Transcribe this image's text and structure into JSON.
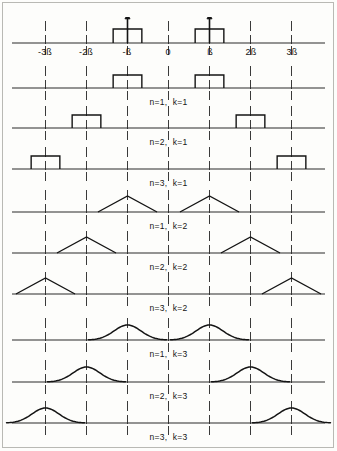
{
  "figure": {
    "title": "",
    "width": 337,
    "height": 451,
    "background": "#fdfdfb",
    "ink_color": "#141414",
    "axis_color": "#2b2b2b",
    "grid_color": "#3a3a3a"
  },
  "axis": {
    "x_start_px": 12,
    "x_end_px": 325,
    "origin_px": 168.5,
    "beta_spacing_px": 41,
    "tick_labels": [
      {
        "text": "-3ß",
        "x_px": 45
      },
      {
        "text": "-2ß",
        "x_px": 86
      },
      {
        "text": "-ß",
        "x_px": 127
      },
      {
        "text": "0",
        "x_px": 168
      },
      {
        "text": "ß",
        "x_px": 210
      },
      {
        "text": "2ß",
        "x_px": 251
      },
      {
        "text": "3ß",
        "x_px": 292
      }
    ],
    "grid_positions_beta": [
      -3,
      -2,
      -1,
      0,
      1,
      2,
      3
    ]
  },
  "panels": [
    {
      "id": "reference",
      "label": "",
      "shape": "rect-impulse",
      "n": 1,
      "k": 1,
      "has_ticklabels": true,
      "has_arrow": true,
      "axis_y_px": 43,
      "pulse_half_width_beta": 0.35,
      "pulse_height_px": 14,
      "arrow_height_px": 30,
      "centers_beta": [
        -1,
        1
      ]
    },
    {
      "id": "n1k1",
      "label": "n=1,  k=1",
      "shape": "rect",
      "n": 1,
      "k": 1,
      "has_ticklabels": false,
      "has_arrow": false,
      "axis_y_px": 88,
      "pulse_half_width_beta": 0.35,
      "pulse_height_px": 13,
      "centers_beta": [
        -1,
        1
      ]
    },
    {
      "id": "n2k1",
      "label": "n=2,  k=1",
      "shape": "rect",
      "n": 2,
      "k": 1,
      "has_ticklabels": false,
      "has_arrow": false,
      "axis_y_px": 128,
      "pulse_half_width_beta": 0.35,
      "pulse_height_px": 13,
      "centers_beta": [
        -2,
        2
      ]
    },
    {
      "id": "n3k1",
      "label": "n=3,  k=1",
      "shape": "rect",
      "n": 3,
      "k": 1,
      "has_ticklabels": false,
      "has_arrow": false,
      "axis_y_px": 169,
      "pulse_half_width_beta": 0.35,
      "pulse_height_px": 13,
      "centers_beta": [
        -3,
        3
      ]
    },
    {
      "id": "n1k2",
      "label": "n=1,  k=2",
      "shape": "triangle",
      "n": 1,
      "k": 2,
      "has_ticklabels": false,
      "has_arrow": false,
      "axis_y_px": 212,
      "pulse_half_width_beta": 0.72,
      "pulse_height_px": 16,
      "centers_beta": [
        -1,
        1
      ]
    },
    {
      "id": "n2k2",
      "label": "n=2,  k=2",
      "shape": "triangle",
      "n": 2,
      "k": 2,
      "has_ticklabels": false,
      "has_arrow": false,
      "axis_y_px": 253,
      "pulse_half_width_beta": 0.72,
      "pulse_height_px": 16,
      "centers_beta": [
        -2,
        2
      ]
    },
    {
      "id": "n3k2",
      "label": "n=3,  k=2",
      "shape": "triangle",
      "n": 3,
      "k": 2,
      "has_ticklabels": false,
      "has_arrow": false,
      "axis_y_px": 294,
      "pulse_half_width_beta": 0.72,
      "pulse_height_px": 16,
      "centers_beta": [
        -3,
        3
      ]
    },
    {
      "id": "n1k3",
      "label": "n=1,  k=3",
      "shape": "bell",
      "n": 1,
      "k": 3,
      "has_ticklabels": false,
      "has_arrow": false,
      "axis_y_px": 340,
      "pulse_half_width_beta": 0.95,
      "pulse_height_px": 15,
      "centers_beta": [
        -1,
        1
      ]
    },
    {
      "id": "n2k3",
      "label": "n=2,  k=3",
      "shape": "bell",
      "n": 2,
      "k": 3,
      "has_ticklabels": false,
      "has_arrow": false,
      "axis_y_px": 382,
      "pulse_half_width_beta": 0.95,
      "pulse_height_px": 15,
      "centers_beta": [
        -2,
        2
      ]
    },
    {
      "id": "n3k3",
      "label": "n=3,  k=3",
      "shape": "bell",
      "n": 3,
      "k": 3,
      "has_ticklabels": false,
      "has_arrow": false,
      "axis_y_px": 423,
      "pulse_half_width_beta": 0.95,
      "pulse_height_px": 15,
      "centers_beta": [
        -3,
        3
      ]
    }
  ],
  "chart_data": {
    "type": "line",
    "xlabel": "",
    "ylabel": "",
    "x_tick_labels": [
      "-3ß",
      "-2ß",
      "-ß",
      "0",
      "ß",
      "2ß",
      "3ß"
    ],
    "x_tick_values": [
      -3,
      -2,
      -1,
      0,
      1,
      2,
      3
    ],
    "xlim": [
      -3.8,
      3.8
    ],
    "grid": true,
    "legend": "none",
    "series": [
      {
        "name": "reference (impulse + rect)",
        "n": 1,
        "k": 1,
        "centers": [
          -1,
          1
        ],
        "shape": "rect-impulse",
        "half_width": 0.35,
        "height": 1.0
      },
      {
        "name": "n=1,  k=1",
        "n": 1,
        "k": 1,
        "centers": [
          -1,
          1
        ],
        "shape": "rect",
        "half_width": 0.35,
        "height": 1.0
      },
      {
        "name": "n=2,  k=1",
        "n": 2,
        "k": 1,
        "centers": [
          -2,
          2
        ],
        "shape": "rect",
        "half_width": 0.35,
        "height": 1.0
      },
      {
        "name": "n=3,  k=1",
        "n": 3,
        "k": 1,
        "centers": [
          -3,
          3
        ],
        "shape": "rect",
        "half_width": 0.35,
        "height": 1.0
      },
      {
        "name": "n=1,  k=2",
        "n": 1,
        "k": 2,
        "centers": [
          -1,
          1
        ],
        "shape": "triangle",
        "half_width": 0.72,
        "height": 1.0
      },
      {
        "name": "n=2,  k=2",
        "n": 2,
        "k": 2,
        "centers": [
          -2,
          2
        ],
        "shape": "triangle",
        "half_width": 0.72,
        "height": 1.0
      },
      {
        "name": "n=3,  k=2",
        "n": 3,
        "k": 2,
        "centers": [
          -3,
          3
        ],
        "shape": "triangle",
        "half_width": 0.72,
        "height": 1.0
      },
      {
        "name": "n=1,  k=3",
        "n": 1,
        "k": 3,
        "centers": [
          -1,
          1
        ],
        "shape": "bell",
        "half_width": 0.95,
        "height": 1.0
      },
      {
        "name": "n=2,  k=3",
        "n": 2,
        "k": 3,
        "centers": [
          -2,
          2
        ],
        "shape": "bell",
        "half_width": 0.95,
        "height": 1.0
      },
      {
        "name": "n=3,  k=3",
        "n": 3,
        "k": 3,
        "centers": [
          -3,
          3
        ],
        "shape": "bell",
        "half_width": 0.95,
        "height": 1.0
      }
    ]
  }
}
